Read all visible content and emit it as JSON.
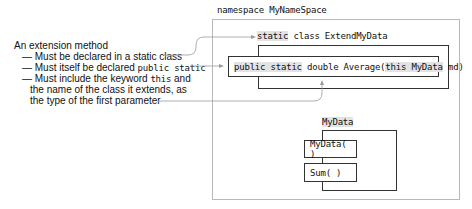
{
  "annotation": {
    "title": "An extension method",
    "bullets": [
      {
        "dash": "—",
        "text": "Must be declared in a static class"
      },
      {
        "dash": "—",
        "text_before": "Must itself be declared ",
        "code": "public static"
      },
      {
        "dash": "—",
        "text_before": "Must include the keyword ",
        "code": "this",
        "text_after": " and"
      }
    ],
    "continuation": [
      "the name of the class it extends, as",
      "the type of the first parameter"
    ]
  },
  "diagram": {
    "namespace_label": "namespace MyNameSpace",
    "extend_class": {
      "keyword": "static",
      "rest": " class ExtendMyData"
    },
    "method": {
      "keyword": "public static",
      "mid": " double Average(",
      "param_highlight": "this MyData",
      "end": " md)"
    },
    "mydata_class": {
      "label": "MyData",
      "members": [
        "MyData( )",
        "Sum( )"
      ]
    }
  },
  "colors": {
    "highlight": "#e3e3e3",
    "box_border": "#333333",
    "namespace_border": "#b9b9b9",
    "connector": "#9a9a9a"
  }
}
